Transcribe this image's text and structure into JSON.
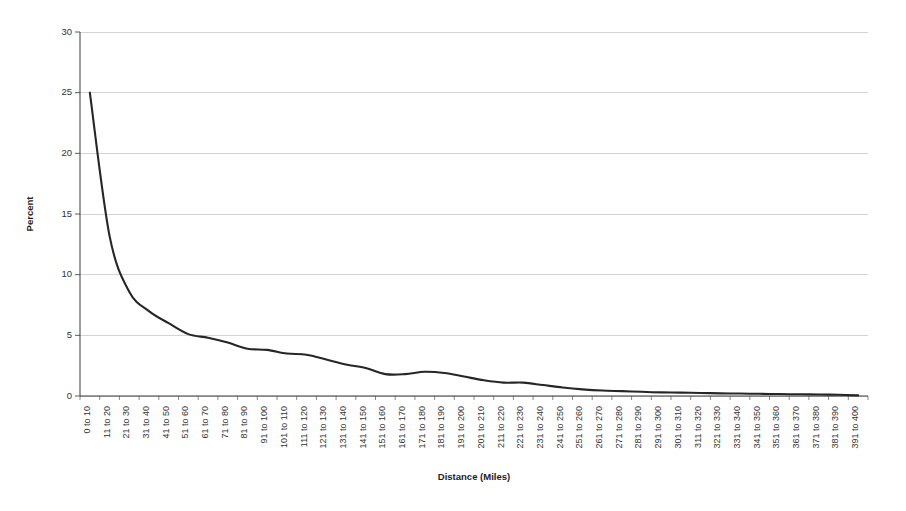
{
  "chart_data": {
    "type": "line",
    "title": "",
    "xlabel": "Distance (Miles)",
    "ylabel": "Percent",
    "ylim": [
      0,
      30
    ],
    "yticks": [
      0,
      5,
      10,
      15,
      20,
      25,
      30
    ],
    "ytick_labels": [
      "0",
      "5",
      "10",
      "15",
      "20",
      "25",
      "30"
    ],
    "grid": true,
    "legend": false,
    "legend_position": "none",
    "line_color": "#262626",
    "gridline_color": "#c9c9c9",
    "background_color": "#ffffff",
    "categories": [
      "0 to 10",
      "11 to 20",
      "21 to 30",
      "31 to 40",
      "41 to 50",
      "51 to 60",
      "61 to 70",
      "71 to 80",
      "81 to 90",
      "91 to 100",
      "101 to 110",
      "111 to 120",
      "121 to 130",
      "131 to 140",
      "141 to 150",
      "151 to 160",
      "161 to 170",
      "171 to 180",
      "181 to 190",
      "191 to 200",
      "201 to 210",
      "211 to 220",
      "221 to 230",
      "231 to 240",
      "241 to 250",
      "251 to 260",
      "261 to 270",
      "271 to 280",
      "281 to 290",
      "291 to 300",
      "301 to 310",
      "311 to 320",
      "321 to 330",
      "331 to 340",
      "341 to 350",
      "351 to 360",
      "361 to 370",
      "371 to 380",
      "381 to 390",
      "391 to 400"
    ],
    "values": [
      25.0,
      13.2,
      8.6,
      7.0,
      6.0,
      5.1,
      4.8,
      4.4,
      3.9,
      3.8,
      3.5,
      3.4,
      3.0,
      2.6,
      2.3,
      1.8,
      1.8,
      2.0,
      1.9,
      1.6,
      1.3,
      1.1,
      1.1,
      0.9,
      0.7,
      0.55,
      0.45,
      0.4,
      0.35,
      0.3,
      0.28,
      0.25,
      0.22,
      0.2,
      0.18,
      0.16,
      0.14,
      0.12,
      0.1,
      0.05
    ]
  }
}
